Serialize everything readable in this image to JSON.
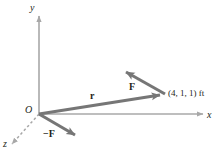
{
  "figure": {
    "type": "vector-diagram",
    "width": 221,
    "height": 154,
    "background_color": "#ffffff",
    "axis_color": "#a8a8a8",
    "vector_color": "#767676",
    "text_color": "#231f20"
  },
  "axes": {
    "y": {
      "label": "y",
      "style": "solid",
      "from": [
        39,
        114
      ],
      "to": [
        39,
        14
      ]
    },
    "x": {
      "label": "x",
      "style": "solid",
      "from": [
        39,
        114
      ],
      "to": [
        205,
        114
      ]
    },
    "z": {
      "label": "z",
      "style": "dashed",
      "from": [
        39,
        114
      ],
      "to": [
        10,
        146
      ]
    }
  },
  "origin": {
    "label": "O",
    "position": [
      39,
      114
    ]
  },
  "vectors": [
    {
      "name": "r",
      "label": "r",
      "bold": true,
      "from": [
        39,
        114
      ],
      "to": [
        165,
        94
      ],
      "description": "position vector from origin to point (4, 1, 1) ft"
    },
    {
      "name": "F",
      "label": "F",
      "bold": true,
      "from": [
        165,
        94
      ],
      "to": [
        122,
        70
      ],
      "description": "force vector applied at point (4, 1, 1) ft"
    },
    {
      "name": "-F",
      "label": "−F",
      "bold": true,
      "from": [
        39,
        114
      ],
      "to": [
        79,
        137
      ],
      "description": "equal and opposite force vector at the origin"
    }
  ],
  "points": [
    {
      "name": "point-411",
      "label": "(4, 1, 1) ft",
      "position": [
        165,
        94
      ]
    }
  ]
}
